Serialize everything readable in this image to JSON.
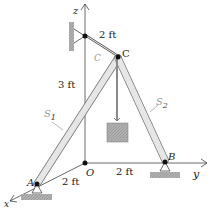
{
  "diagram": {
    "axes": {
      "x_label": "x",
      "y_label": "y",
      "z_label": "z"
    },
    "points": {
      "origin": "O",
      "A": "A",
      "B": "B",
      "C": "C"
    },
    "members": {
      "strut1": "S",
      "strut1_sub": "1",
      "strut2": "S",
      "strut2_sub": "2",
      "cable": "C"
    },
    "dimensions": {
      "cable_length": "2 ft",
      "height_OC": "3 ft",
      "OA": "2 ft",
      "OB": "2 ft"
    },
    "colors": {
      "strut_fill": "#e6e6e6",
      "strut_edge": "#777777",
      "ground": "#aaaaaa",
      "weight": "#b5b5b5",
      "line": "#444444"
    }
  }
}
